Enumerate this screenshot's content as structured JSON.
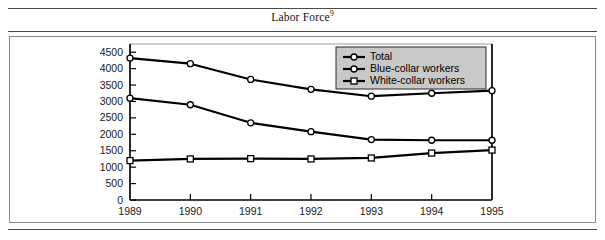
{
  "figure": {
    "title": "Labor Force",
    "title_superscript": "9"
  },
  "chart_data": {
    "type": "line",
    "title": "Labor Force",
    "xlabel": "",
    "ylabel": "",
    "x": [
      "1989",
      "1990",
      "1991",
      "1992",
      "1993",
      "1994",
      "1995"
    ],
    "categories": [
      "1989",
      "1990",
      "1991",
      "1992",
      "1993",
      "1994",
      "1995"
    ],
    "series": [
      {
        "name": "Total",
        "marker": "circle",
        "values": [
          4320,
          4150,
          3670,
          3370,
          3160,
          3250,
          3330
        ]
      },
      {
        "name": "Blue-collar workers",
        "marker": "circle",
        "values": [
          3100,
          2900,
          2350,
          2080,
          1840,
          1820,
          1820
        ]
      },
      {
        "name": "White-collar workers",
        "marker": "square",
        "values": [
          1200,
          1250,
          1260,
          1250,
          1280,
          1430,
          1520
        ]
      }
    ],
    "ylim": [
      0,
      4750
    ],
    "yticks": [
      0,
      500,
      1000,
      1500,
      2000,
      2500,
      3000,
      3500,
      4000,
      4500
    ],
    "ytick_labels": [
      "0",
      "500",
      "1000",
      "1500",
      "2000",
      "2500",
      "3000",
      "3500",
      "4000",
      "4500"
    ],
    "xtick_labels": [
      "1989",
      "1990",
      "1991",
      "1992",
      "1993",
      "1994",
      "1995"
    ],
    "grid": false,
    "legend_position": "top-right",
    "legend_entries": [
      "Total",
      "Blue-collar workers",
      "White-collar workers"
    ],
    "colors": {
      "line": "#000000",
      "marker_fill": "#ffffff",
      "legend_background": "#c9c9c9",
      "frame": "#9a9a9a",
      "rule": "#4a4a4a"
    }
  }
}
